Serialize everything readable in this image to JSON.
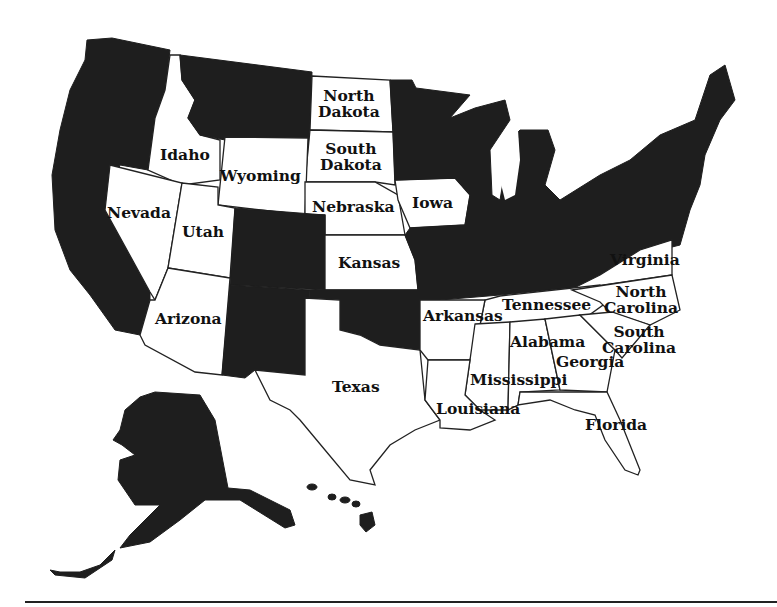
{
  "map": {
    "type": "US states map, two-tone (shaded vs unshaded)",
    "colors": {
      "shaded": "#1e1e1e",
      "unshaded": "#ffffff",
      "border": "#222222"
    },
    "labels": {
      "north_dakota": [
        "North",
        "Dakota"
      ],
      "south_dakota": [
        "South",
        "Dakota"
      ],
      "idaho": "Idaho",
      "wyoming": "Wyoming",
      "nebraska": "Nebraska",
      "nevada": "Nevada",
      "utah": "Utah",
      "iowa": "Iowa",
      "kansas": "Kansas",
      "arizona": "Arizona",
      "virginia": "Virginia",
      "north_carolina": [
        "North",
        "Carolina"
      ],
      "tennessee": "Tennessee",
      "arkansas": "Arkansas",
      "south_carolina": [
        "South",
        "Carolina"
      ],
      "alabama": "Alabama",
      "georgia": "Georgia",
      "mississippi": "Mississippi",
      "texas": "Texas",
      "louisiana": "Louisiana",
      "florida": "Florida"
    },
    "unshaded_states": [
      "North Dakota",
      "South Dakota",
      "Idaho",
      "Wyoming",
      "Nebraska",
      "Nevada",
      "Utah",
      "Iowa",
      "Kansas",
      "Arizona",
      "Virginia",
      "North Carolina",
      "Tennessee",
      "Arkansas",
      "South Carolina",
      "Alabama",
      "Georgia",
      "Mississippi",
      "Texas",
      "Louisiana",
      "Florida"
    ],
    "shaded_regions": [
      "Washington",
      "Oregon",
      "California",
      "Montana",
      "Colorado",
      "New Mexico",
      "Oklahoma",
      "Minnesota",
      "Wisconsin",
      "Michigan",
      "Illinois",
      "Missouri",
      "Indiana",
      "Ohio",
      "Kentucky",
      "West Virginia",
      "Pennsylvania",
      "New York",
      "New England",
      "Maryland",
      "Delaware",
      "New Jersey",
      "Alaska",
      "Hawaii"
    ]
  }
}
